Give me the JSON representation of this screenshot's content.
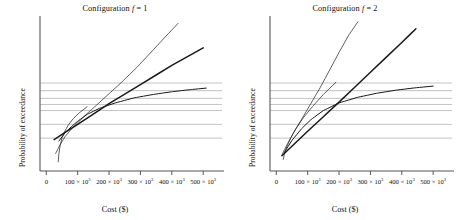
{
  "figure": {
    "panel_count": 2,
    "background": "#ffffff"
  },
  "chart_data": [
    {
      "type": "line",
      "title_prefix": "Configuration ",
      "title_var": "f",
      "title_suffix": " = 1",
      "title": "Configuration f = 1",
      "xlabel": "Cost ($)",
      "ylabel": "Probability of exceedance",
      "grid": true,
      "grid_orientation": "horizontal",
      "grid_color": "#b4b4b4",
      "curve_color": "#1a1a1a",
      "axis_color": "#555555",
      "legend": "none",
      "xlim": [
        -20000,
        560000
      ],
      "ylim": [
        0,
        1
      ],
      "xticks": [
        0,
        100000,
        200000,
        300000,
        400000,
        500000
      ],
      "xticklabels": [
        "0",
        "100 × 10",
        "200 × 10",
        "300 × 10",
        "400 × 10",
        "500 × 10"
      ],
      "xtick_exponent": "3",
      "yticks": [],
      "yticklabels": [],
      "gridlines_y": [
        0.215,
        0.305,
        0.395,
        0.435,
        0.475,
        0.525,
        0.575
      ],
      "series": [
        {
          "name": "steep-thin-curve",
          "style": "thin",
          "width": 0.7,
          "x": [
            30000,
            45000,
            60000,
            80000,
            100000,
            130000,
            160000,
            200000,
            240000,
            290000,
            340000,
            390000,
            420000
          ],
          "y": [
            0.115,
            0.175,
            0.225,
            0.275,
            0.315,
            0.375,
            0.43,
            0.505,
            0.58,
            0.68,
            0.79,
            0.9,
            0.965
          ]
        },
        {
          "name": "straight-thick-line",
          "style": "thick",
          "width": 1.5,
          "x": [
            25000,
            100000,
            200000,
            300000,
            400000,
            500000
          ],
          "y": [
            0.205,
            0.305,
            0.44,
            0.565,
            0.69,
            0.805
          ]
        },
        {
          "name": "saturating-curve",
          "style": "medium",
          "width": 1.0,
          "x": [
            40000,
            60000,
            80000,
            100000,
            130000,
            170000,
            220000,
            280000,
            340000,
            400000,
            460000,
            510000
          ],
          "y": [
            0.195,
            0.25,
            0.29,
            0.325,
            0.37,
            0.41,
            0.445,
            0.478,
            0.5,
            0.518,
            0.532,
            0.542
          ]
        },
        {
          "name": "hook-thin-curve",
          "style": "thin",
          "width": 0.7,
          "x": [
            38000,
            40000,
            44000,
            50000,
            58000,
            70000,
            85000,
            105000,
            130000
          ],
          "y": [
            0.06,
            0.11,
            0.165,
            0.215,
            0.255,
            0.3,
            0.34,
            0.38,
            0.42
          ]
        }
      ]
    },
    {
      "type": "line",
      "title_prefix": "Configuration ",
      "title_var": "f",
      "title_suffix": " = 2",
      "title": "Configuration f = 2",
      "xlabel": "Cost ($)",
      "ylabel": "Probability of exceedance",
      "grid": true,
      "grid_orientation": "horizontal",
      "grid_color": "#b4b4b4",
      "curve_color": "#1a1a1a",
      "axis_color": "#555555",
      "legend": "none",
      "xlim": [
        -20000,
        560000
      ],
      "ylim": [
        0,
        1
      ],
      "xticks": [
        0,
        100000,
        200000,
        300000,
        400000,
        500000
      ],
      "xticklabels": [
        "0",
        "100 × 10",
        "200 × 10",
        "300 × 10",
        "400 × 10",
        "500 × 10"
      ],
      "xtick_exponent": "3",
      "yticks": [],
      "yticklabels": [],
      "gridlines_y": [
        0.215,
        0.305,
        0.395,
        0.435,
        0.475,
        0.525,
        0.575
      ],
      "series": [
        {
          "name": "steep-thin-curve",
          "style": "thin",
          "width": 0.7,
          "x": [
            18000,
            35000,
            55000,
            80000,
            110000,
            140000,
            170000,
            200000,
            230000,
            260000
          ],
          "y": [
            0.105,
            0.175,
            0.25,
            0.335,
            0.44,
            0.545,
            0.66,
            0.775,
            0.885,
            0.975
          ]
        },
        {
          "name": "straight-thick-line",
          "style": "thick",
          "width": 1.5,
          "x": [
            18000,
            100000,
            200000,
            300000,
            400000,
            445000
          ],
          "y": [
            0.1,
            0.26,
            0.45,
            0.645,
            0.84,
            0.93
          ]
        },
        {
          "name": "saturating-curve",
          "style": "medium",
          "width": 1.0,
          "x": [
            25000,
            50000,
            80000,
            110000,
            150000,
            200000,
            260000,
            320000,
            380000,
            440000,
            500000
          ],
          "y": [
            0.12,
            0.2,
            0.275,
            0.335,
            0.395,
            0.445,
            0.482,
            0.508,
            0.528,
            0.543,
            0.555
          ]
        },
        {
          "name": "hook-thin-curve",
          "style": "thin",
          "width": 0.7,
          "x": [
            22000,
            26000,
            34000,
            46000,
            62000,
            85000,
            115000,
            150000,
            190000
          ],
          "y": [
            0.075,
            0.11,
            0.16,
            0.215,
            0.275,
            0.345,
            0.42,
            0.5,
            0.58
          ]
        }
      ]
    }
  ]
}
